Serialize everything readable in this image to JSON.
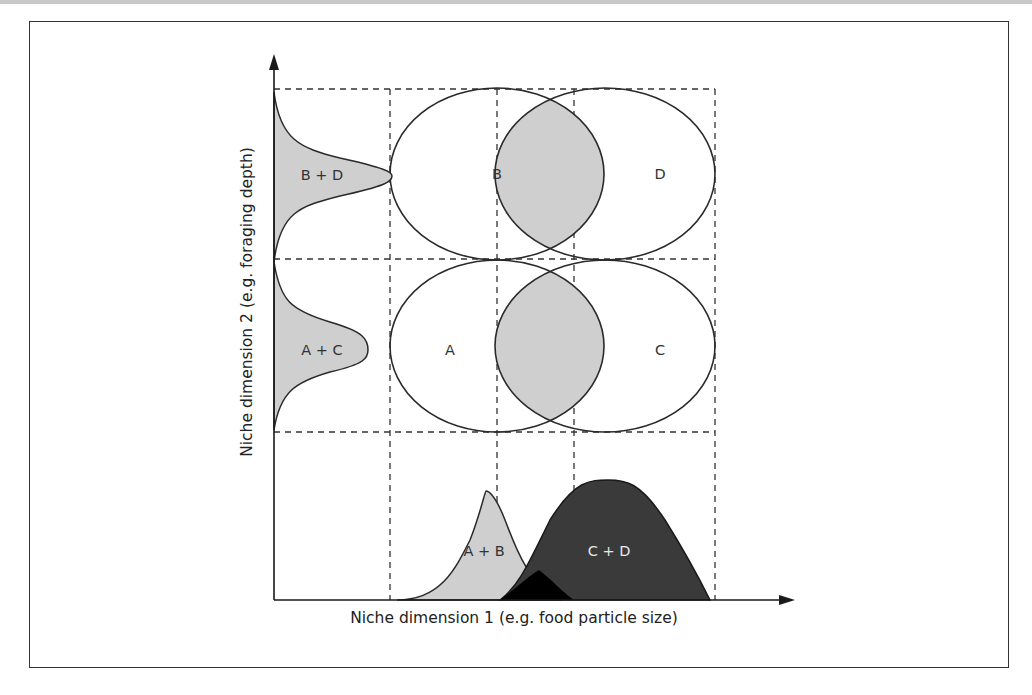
{
  "figure": {
    "x_axis_label": "Niche dimension 1 (e.g. food particle size)",
    "y_axis_label": "Niche dimension 2 (e.g. foraging depth)",
    "niche_labels": {
      "A": "A",
      "B": "B",
      "C": "C",
      "D": "D"
    },
    "marginal_labels": {
      "y_top": "B + D",
      "y_bottom": "A + C",
      "x_left": "A + B",
      "x_right": "C + D"
    },
    "colors": {
      "light_fill": "#cfcfcf",
      "dark_fill": "#3a3a3a",
      "overlap_fill": "#000000",
      "line": "#2a2a2a",
      "frame": "#333333"
    }
  }
}
